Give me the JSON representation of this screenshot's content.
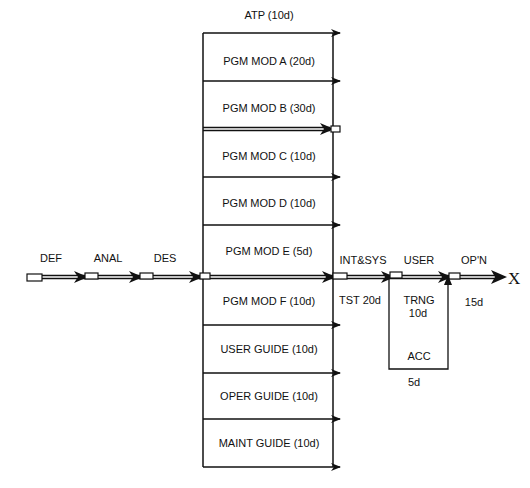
{
  "diagram": {
    "type": "activity-network",
    "top_label": "ATP (10d)",
    "parallel_tasks": [
      {
        "label": "PGM MOD A (20d)"
      },
      {
        "label": "PGM MOD B (30d)"
      },
      {
        "label": "PGM MOD C (10d)"
      },
      {
        "label": "PGM MOD D (10d)"
      },
      {
        "label": "PGM MOD E (5d)"
      },
      {
        "label": "PGM MOD F (10d)"
      },
      {
        "label": "USER GUIDE (10d)"
      },
      {
        "label": "OPER GUIDE (10d)"
      },
      {
        "label": "MAINT GUIDE (10d)"
      }
    ],
    "main_path": [
      {
        "label": "DEF"
      },
      {
        "label": "ANAL"
      },
      {
        "label": "DES"
      },
      {
        "label": "INT&SYS",
        "sub": "TST 20d"
      },
      {
        "label": "USER",
        "sub": "TRNG",
        "sub2": "10d"
      },
      {
        "label": "OP'N",
        "sub": "15d"
      }
    ],
    "acc_box": {
      "label": "ACC",
      "duration": "5d"
    },
    "end_marker": "X"
  }
}
